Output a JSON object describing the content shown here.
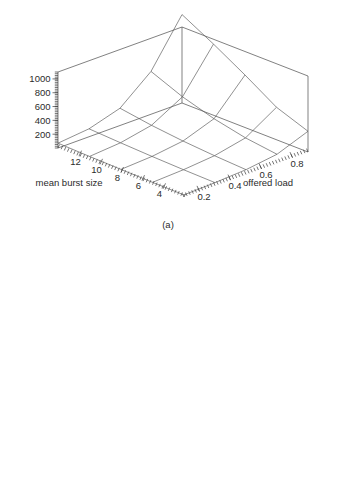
{
  "figure": {
    "background_color": "#ffffff",
    "line_color": "#555555",
    "text_color": "#2b2b2b"
  },
  "chart_data": [
    {
      "type": "line",
      "subtype": "3d-surface-wireframe",
      "panel": "(a)",
      "title": "",
      "xlabel": "offered load",
      "ylabel": "mean burst size",
      "zlabel": "",
      "x": [
        0.1,
        0.2,
        0.3,
        0.4,
        0.5,
        0.6,
        0.7,
        0.8,
        0.9
      ],
      "y": [
        2,
        4,
        6,
        8,
        10,
        12,
        14
      ],
      "x_ticks": [
        "0.2",
        "0.4",
        "0.6",
        "0.8"
      ],
      "x_tick_values": [
        0.2,
        0.4,
        0.6,
        0.8
      ],
      "y_ticks": [
        "12",
        "10",
        "8",
        "6",
        "4"
      ],
      "y_tick_values": [
        12,
        10,
        8,
        6,
        4
      ],
      "z_ticks": [
        "200",
        "400",
        "600",
        "800",
        "1000"
      ],
      "z_tick_values": [
        200,
        400,
        600,
        800,
        1000
      ],
      "zlim": [
        0,
        1100
      ],
      "grid": false,
      "legend": null,
      "grid_x": [
        0.1,
        0.3,
        0.5,
        0.7,
        0.9
      ],
      "grid_y": [
        2,
        5,
        8,
        11,
        14
      ],
      "z_matrix": [
        [
          30,
          45,
          70,
          130,
          300
        ],
        [
          35,
          55,
          95,
          190,
          470
        ],
        [
          45,
          70,
          130,
          290,
          760
        ],
        [
          55,
          90,
          180,
          430,
          1030
        ],
        [
          70,
          115,
          250,
          620,
          1280
        ]
      ]
    },
    {
      "type": "line",
      "subtype": "3d-surface-wireframe",
      "panel": "(b)",
      "title": "",
      "xlabel": "offered load",
      "ylabel": "mean burst size",
      "zlabel": "",
      "x": [
        0.1,
        0.2,
        0.3,
        0.4,
        0.5,
        0.6,
        0.7,
        0.8,
        0.9
      ],
      "y": [
        2,
        4,
        6,
        8,
        10,
        12,
        14
      ],
      "x_ticks": [
        "0.2",
        "0.4",
        "0.6",
        "0.8"
      ],
      "x_tick_values": [
        0.2,
        0.4,
        0.6,
        0.8
      ],
      "y_ticks": [
        "12",
        "10",
        "8",
        "6",
        "4"
      ],
      "y_tick_values": [
        12,
        10,
        8,
        6,
        4
      ],
      "z_ticks": [
        "20",
        "40",
        "60",
        "80",
        "100",
        "120"
      ],
      "z_tick_values": [
        20,
        40,
        60,
        80,
        100,
        120
      ],
      "zlim": [
        0,
        135
      ],
      "grid": false,
      "legend": null,
      "grid_x": [
        0.1,
        0.3,
        0.5,
        0.7,
        0.9
      ],
      "grid_y": [
        2,
        5,
        8,
        11,
        14
      ],
      "z_matrix": [
        [
          4,
          6,
          10,
          20,
          52
        ],
        [
          5,
          8,
          14,
          30,
          78
        ],
        [
          6,
          10,
          19,
          44,
          108
        ],
        [
          7,
          13,
          26,
          62,
          132
        ],
        [
          9,
          16,
          34,
          82,
          150
        ]
      ]
    }
  ],
  "panels": [
    {
      "caption": "(a)",
      "xlabel": "offered load",
      "ylabel": "mean burst size"
    },
    {
      "caption": "(b)",
      "xlabel": "offered load",
      "ylabel": "mean burst size"
    }
  ]
}
